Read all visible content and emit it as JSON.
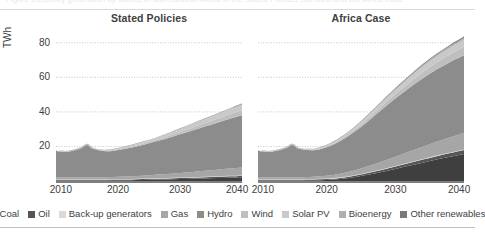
{
  "figure": {
    "clipped_caption": "Figure  Electricity generation by source in sub-Saharan Africa in the Stated Policies Scenario and the Africa Case"
  },
  "chart_data": {
    "type": "area",
    "title": "",
    "xlabel": "",
    "ylabel": "TWh",
    "xlim": [
      2010,
      2040
    ],
    "ylim": [
      0,
      88
    ],
    "yticks": [
      20,
      40,
      60,
      80
    ],
    "xticks": [
      2010,
      2020,
      2030,
      2040
    ],
    "grid": "horizontal-dotted",
    "legend_position": "bottom",
    "stacked": true,
    "series_order": [
      "Coal",
      "Oil",
      "Back-up generators",
      "Gas",
      "Hydro",
      "Wind",
      "Solar PV",
      "Bioenergy",
      "Other renewables"
    ],
    "colors": {
      "Coal": "#3f3f3f",
      "Oil": "#565656",
      "Back-up generators": "#d9d9d9",
      "Gas": "#a6a6a6",
      "Hydro": "#8c8c8c",
      "Wind": "#bfbfbf",
      "Solar PV": "#c9c9c9",
      "Bioenergy": "#b0b0b0",
      "Other renewables": "#787878"
    },
    "panels": [
      {
        "name": "Stated Policies",
        "x": [
          2010,
          2012,
          2014,
          2015,
          2016,
          2018,
          2020,
          2022,
          2024,
          2026,
          2028,
          2030,
          2032,
          2034,
          2036,
          2038,
          2040
        ],
        "series": [
          {
            "name": "Coal",
            "values": [
              0.3,
              0.3,
              0.3,
              0.3,
              0.3,
              0.3,
              0.4,
              0.5,
              0.6,
              0.8,
              0.9,
              1.1,
              1.3,
              1.5,
              1.7,
              1.9,
              2.1
            ]
          },
          {
            "name": "Oil",
            "values": [
              0.4,
              0.4,
              0.4,
              0.4,
              0.4,
              0.4,
              0.4,
              0.4,
              0.5,
              0.5,
              0.5,
              0.6,
              0.6,
              0.7,
              0.7,
              0.8,
              0.8
            ]
          },
          {
            "name": "Back-up generators",
            "values": [
              0.3,
              0.3,
              0.3,
              0.3,
              0.3,
              0.3,
              0.3,
              0.3,
              0.3,
              0.3,
              0.3,
              0.3,
              0.3,
              0.3,
              0.3,
              0.3,
              0.3
            ]
          },
          {
            "name": "Gas",
            "values": [
              1.0,
              1.0,
              1.1,
              1.1,
              1.1,
              1.2,
              1.3,
              1.5,
              1.7,
              2.0,
              2.3,
              2.6,
              3.0,
              3.4,
              3.8,
              4.2,
              4.6
            ]
          },
          {
            "name": "Hydro",
            "values": [
              15.4,
              15.0,
              16.8,
              18.8,
              16.5,
              15.0,
              15.6,
              16.6,
              17.8,
              19.2,
              20.8,
              22.4,
              24.0,
              25.6,
              27.2,
              28.8,
              30.2
            ]
          },
          {
            "name": "Wind",
            "values": [
              0.1,
              0.1,
              0.2,
              0.2,
              0.2,
              0.3,
              0.4,
              0.5,
              0.7,
              0.9,
              1.1,
              1.4,
              1.7,
              2.0,
              2.3,
              2.6,
              2.9
            ]
          },
          {
            "name": "Solar PV",
            "values": [
              0.0,
              0.1,
              0.1,
              0.1,
              0.2,
              0.3,
              0.4,
              0.6,
              0.8,
              1.0,
              1.3,
              1.6,
              1.9,
              2.2,
              2.5,
              2.8,
              3.1
            ]
          },
          {
            "name": "Bioenergy",
            "values": [
              0.2,
              0.2,
              0.2,
              0.2,
              0.2,
              0.2,
              0.2,
              0.3,
              0.3,
              0.3,
              0.4,
              0.4,
              0.4,
              0.5,
              0.5,
              0.5,
              0.6
            ]
          },
          {
            "name": "Other renewables",
            "values": [
              0.1,
              0.1,
              0.1,
              0.1,
              0.1,
              0.1,
              0.1,
              0.1,
              0.1,
              0.1,
              0.1,
              0.1,
              0.1,
              0.1,
              0.1,
              0.1,
              0.2
            ]
          }
        ],
        "totals": [
          17.8,
          17.5,
          19.5,
          21.5,
          19.3,
          18.1,
          19.1,
          20.8,
          22.8,
          25.1,
          27.7,
          30.5,
          33.3,
          36.3,
          39.1,
          42.0,
          44.8
        ]
      },
      {
        "name": "Africa Case",
        "x": [
          2010,
          2012,
          2014,
          2015,
          2016,
          2018,
          2020,
          2022,
          2024,
          2026,
          2028,
          2030,
          2032,
          2034,
          2036,
          2038,
          2040
        ],
        "series": [
          {
            "name": "Coal",
            "values": [
              0.3,
              0.3,
              0.3,
              0.3,
              0.3,
              0.4,
              0.6,
              1.2,
              2.2,
              3.6,
              5.2,
              7.0,
              8.8,
              10.6,
              12.4,
              14.0,
              15.6
            ]
          },
          {
            "name": "Oil",
            "values": [
              0.4,
              0.4,
              0.4,
              0.4,
              0.4,
              0.4,
              0.5,
              0.6,
              0.8,
              1.0,
              1.2,
              1.4,
              1.6,
              1.8,
              2.0,
              2.2,
              2.4
            ]
          },
          {
            "name": "Back-up generators",
            "values": [
              0.3,
              0.3,
              0.3,
              0.3,
              0.3,
              0.3,
              0.3,
              0.3,
              0.3,
              0.3,
              0.3,
              0.3,
              0.3,
              0.3,
              0.3,
              0.3,
              0.3
            ]
          },
          {
            "name": "Gas",
            "values": [
              1.0,
              1.0,
              1.1,
              1.1,
              1.1,
              1.3,
              1.6,
              2.1,
              2.8,
              3.6,
              4.5,
              5.4,
              6.3,
              7.2,
              8.0,
              8.8,
              9.5
            ]
          },
          {
            "name": "Hydro",
            "values": [
              15.4,
              15.0,
              16.8,
              18.8,
              16.5,
              15.4,
              16.6,
              19.0,
              22.2,
              26.0,
              30.0,
              33.6,
              36.8,
              39.6,
              41.8,
              43.6,
              45.0
            ]
          },
          {
            "name": "Wind",
            "values": [
              0.1,
              0.1,
              0.2,
              0.2,
              0.2,
              0.3,
              0.5,
              0.8,
              1.2,
              1.6,
              2.1,
              2.6,
              3.1,
              3.6,
              4.1,
              4.5,
              4.9
            ]
          },
          {
            "name": "Solar PV",
            "values": [
              0.0,
              0.1,
              0.1,
              0.1,
              0.2,
              0.3,
              0.5,
              0.8,
              1.2,
              1.6,
              2.0,
              2.4,
              2.8,
              3.2,
              3.5,
              3.8,
              4.1
            ]
          },
          {
            "name": "Bioenergy",
            "values": [
              0.2,
              0.2,
              0.2,
              0.2,
              0.2,
              0.2,
              0.3,
              0.3,
              0.4,
              0.5,
              0.6,
              0.7,
              0.8,
              0.9,
              1.0,
              1.1,
              1.2
            ]
          },
          {
            "name": "Other renewables",
            "values": [
              0.1,
              0.1,
              0.1,
              0.1,
              0.1,
              0.1,
              0.1,
              0.2,
              0.2,
              0.3,
              0.3,
              0.4,
              0.4,
              0.5,
              0.5,
              0.6,
              0.6
            ]
          }
        ],
        "totals": [
          17.8,
          17.5,
          19.5,
          21.5,
          19.3,
          18.7,
          21.0,
          25.3,
          31.3,
          38.5,
          46.2,
          53.8,
          60.9,
          67.7,
          73.6,
          78.9,
          83.6
        ]
      }
    ]
  },
  "legend": {
    "items": [
      {
        "label": "Coal",
        "color": "#3f3f3f"
      },
      {
        "label": "Oil",
        "color": "#565656"
      },
      {
        "label": "Back-up generators",
        "color": "#d9d9d9"
      },
      {
        "label": "Gas",
        "color": "#a6a6a6"
      },
      {
        "label": "Hydro",
        "color": "#8c8c8c"
      },
      {
        "label": "Wind",
        "color": "#bfbfbf"
      },
      {
        "label": "Solar PV",
        "color": "#c9c9c9"
      },
      {
        "label": "Bioenergy",
        "color": "#b0b0b0"
      },
      {
        "label": "Other renewables",
        "color": "#787878"
      }
    ]
  }
}
